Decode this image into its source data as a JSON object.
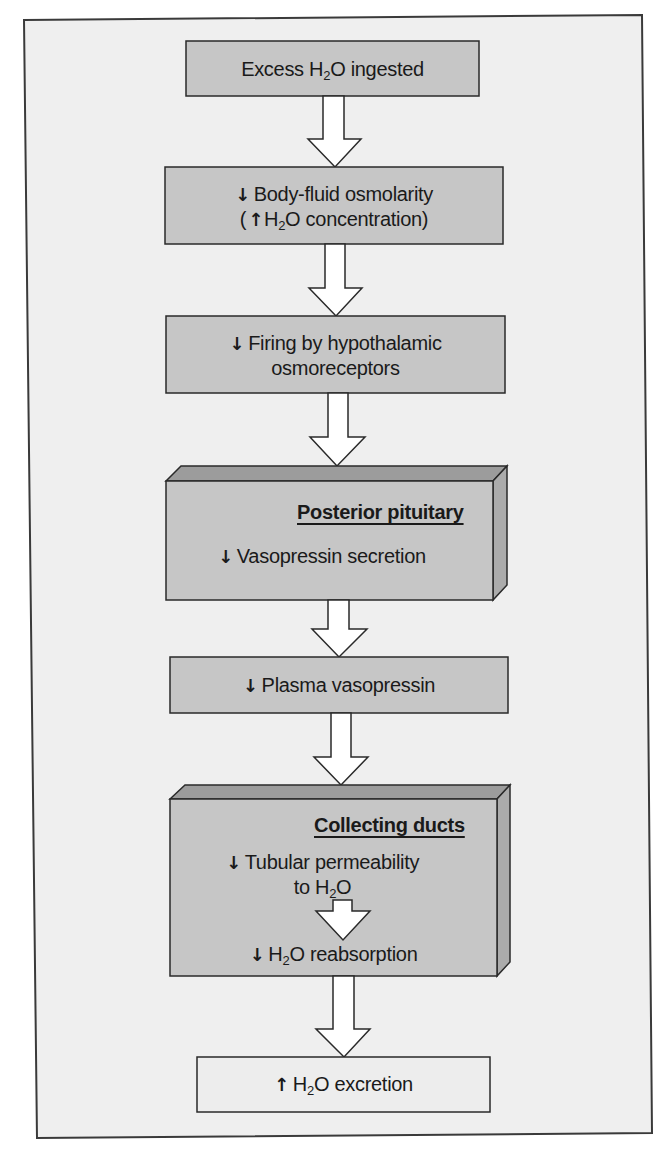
{
  "diagram": {
    "colors": {
      "page": "#ffffff",
      "frame_bg": "#efefef",
      "frame_border": "#3a3a3a",
      "box_fill": "#c6c6c6",
      "box_top": "#9c9c9c",
      "box_side": "#ababab",
      "box_last_fill": "#ededed",
      "arrow_fill": "#ffffff",
      "stroke": "#2a2a2a"
    },
    "symbols": {
      "down_arrow": "↓",
      "up_arrow": "↑"
    },
    "steps": [
      {
        "id": "step-1",
        "pre": "Excess H",
        "sub": "2",
        "post": "O ingested"
      },
      {
        "id": "step-2",
        "arrow": "down",
        "line1": "Body-fluid osmolarity",
        "line2_open": "(",
        "line2_arrow": "up",
        "line2_pre": "H",
        "line2_sub": "2",
        "line2_post": "O concentration)"
      },
      {
        "id": "step-3",
        "arrow": "down",
        "line1": "Firing by hypothalamic",
        "line2": "osmoreceptors"
      },
      {
        "id": "step-4",
        "header": "Posterior pituitary",
        "arrow": "down",
        "line1": "Vasopressin secretion"
      },
      {
        "id": "step-5",
        "arrow": "down",
        "line1": "Plasma vasopressin"
      },
      {
        "id": "step-6",
        "header": "Collecting ducts",
        "arrow": "down",
        "line1": "Tubular permeability",
        "line2_pre": "to H",
        "line2_sub": "2",
        "line2_post": "O",
        "line3_arrow": "down",
        "line3_pre": "H",
        "line3_sub": "2",
        "line3_post": "O reabsorption"
      },
      {
        "id": "step-7",
        "arrow": "up",
        "pre": "H",
        "sub": "2",
        "post": "O excretion"
      }
    ]
  }
}
